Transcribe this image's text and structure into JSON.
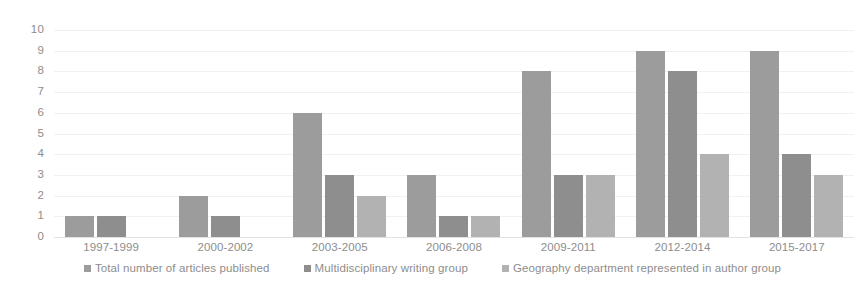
{
  "chart_data": {
    "type": "bar",
    "title": "",
    "subtitle": "",
    "xlabel": "",
    "ylabel": "",
    "grid": true,
    "legend_position": "bottom",
    "ylim": [
      0,
      10
    ],
    "y_ticks": [
      "10",
      "9",
      "8",
      "7",
      "6",
      "5",
      "4",
      "3",
      "2",
      "1",
      "0"
    ],
    "categories": [
      "1997-1999",
      "2000-2002",
      "2003-2005",
      "2006-2008",
      "2009-2011",
      "2012-2014",
      "2015-2017"
    ],
    "series": [
      {
        "name": "Total number of articles published",
        "color": "#9c9c9c",
        "values": [
          1,
          2,
          6,
          3,
          8,
          9,
          9
        ]
      },
      {
        "name": "Multidisciplinary writing group",
        "color": "#8e8e8e",
        "values": [
          1,
          1,
          3,
          1,
          3,
          8,
          4
        ]
      },
      {
        "name": "Geography department represented in author group",
        "color": "#b2b2b2",
        "values": [
          0,
          0,
          2,
          1,
          3,
          4,
          3
        ]
      }
    ]
  }
}
